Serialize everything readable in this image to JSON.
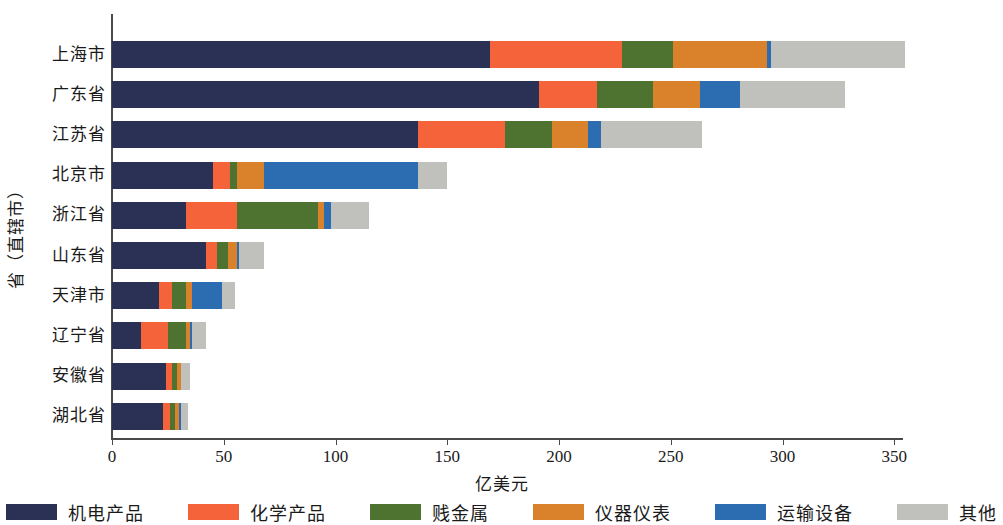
{
  "chart_data": {
    "type": "bar",
    "orientation": "horizontal",
    "stacked": true,
    "title": "",
    "xlabel": "亿美元",
    "ylabel": "省（直辖市）",
    "xlim": [
      0,
      370
    ],
    "xticks": [
      0,
      50,
      100,
      150,
      200,
      250,
      300,
      350
    ],
    "xtick_labels": [
      "0",
      "50",
      "100",
      "150",
      "200",
      "250",
      "300",
      "350"
    ],
    "grid": false,
    "legend_position": "bottom",
    "categories": [
      "上海市",
      "广东省",
      "江苏省",
      "北京市",
      "浙江省",
      "山东省",
      "天津市",
      "辽宁省",
      "安徽省",
      "湖北省"
    ],
    "series": [
      {
        "name": "机电产品",
        "color": "#2b3154",
        "values": [
          169,
          191,
          137,
          45,
          33,
          42,
          21,
          13,
          24,
          23
        ]
      },
      {
        "name": "化学产品",
        "color": "#f4633a",
        "values": [
          59,
          26,
          39,
          8,
          23,
          5,
          6,
          12,
          3,
          3
        ]
      },
      {
        "name": "贱金属",
        "color": "#4e7230",
        "values": [
          23,
          25,
          21,
          3,
          36,
          5,
          6,
          8,
          2,
          2
        ]
      },
      {
        "name": "仪器仪表",
        "color": "#d9822b",
        "values": [
          42,
          21,
          16,
          12,
          3,
          4,
          3,
          2,
          2,
          2
        ]
      },
      {
        "name": "运输设备",
        "color": "#2c6cb0",
        "values": [
          2,
          18,
          6,
          69,
          3,
          1,
          13,
          1,
          0,
          1
        ]
      },
      {
        "name": "其他",
        "color": "#c0c0bd",
        "values": [
          60,
          47,
          45,
          13,
          17,
          11,
          6,
          6,
          4,
          3
        ]
      }
    ],
    "totals": [
      355,
      328,
      264,
      150,
      115,
      68,
      55,
      42,
      35,
      34
    ]
  },
  "axis": {
    "x_title": "亿美元",
    "y_title": "省（直辖市）"
  },
  "legend": {
    "items": [
      {
        "label": "机电产品",
        "color": "#2b3154"
      },
      {
        "label": "化学产品",
        "color": "#f4633a"
      },
      {
        "label": "贱金属",
        "color": "#4e7230"
      },
      {
        "label": "仪器仪表",
        "color": "#d9822b"
      },
      {
        "label": "运输设备",
        "color": "#2c6cb0"
      },
      {
        "label": "其他",
        "color": "#c0c0bd"
      }
    ]
  }
}
